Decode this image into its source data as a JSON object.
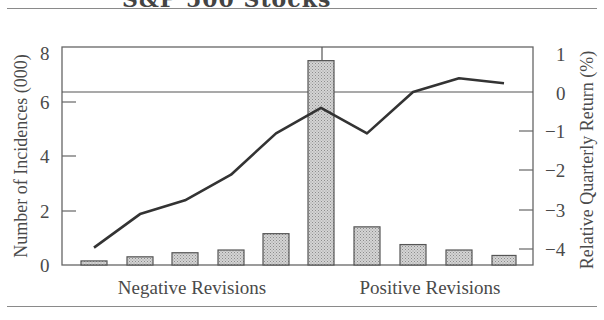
{
  "header": {
    "title_fragment": "S&P 500 Stocks"
  },
  "chart_data": {
    "type": "bar+line",
    "title": "S&P 500 Stocks",
    "xlabel": "",
    "group_labels": [
      "Negative Revisions",
      "Positive Revisions"
    ],
    "categories": [
      1,
      2,
      3,
      4,
      5,
      6,
      7,
      8,
      9,
      10
    ],
    "series": [
      {
        "name": "Number of Incidences (000)",
        "type": "bar",
        "axis": "left",
        "values": [
          0.15,
          0.3,
          0.45,
          0.55,
          1.15,
          7.5,
          1.4,
          0.75,
          0.55,
          0.35
        ]
      },
      {
        "name": "Relative Quarterly Return (%)",
        "type": "line",
        "axis": "right",
        "values": [
          -3.95,
          -3.1,
          -2.75,
          -2.1,
          -1.05,
          -0.4,
          -1.05,
          0.0,
          0.35,
          0.22
        ]
      }
    ],
    "left_axis": {
      "label": "Number of Incidences (000)",
      "ylim": [
        0,
        8
      ],
      "ticks": [
        "0",
        "2",
        "4",
        "6",
        "8"
      ]
    },
    "right_axis": {
      "label": "Relative Quarterly Return (%)",
      "ylim": [
        -4.4,
        1.15
      ],
      "ticks": [
        "1",
        "0",
        "−1",
        "−2",
        "−3",
        "−4"
      ]
    },
    "reference_lines": {
      "horizontal_at_right_value": 0,
      "vertical_between_groups": "category 6"
    },
    "grid": false,
    "legend": "none",
    "colors": {
      "bar_fill": "#c8c8c8",
      "bar_edge": "#555555",
      "line": "#333333",
      "frame": "#666666"
    }
  }
}
